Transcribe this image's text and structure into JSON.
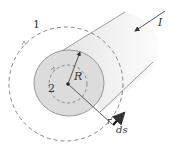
{
  "diagram": {
    "labels": {
      "loop_outer": "1",
      "loop_inner": "2",
      "radius_conductor": "R",
      "radius_loop": "r",
      "line_element": "ds",
      "current": "I"
    },
    "colors": {
      "conductor_face": "#dcdcdc",
      "conductor_body": "#ececec",
      "dashed_loop": "#888888",
      "arrow": "#333333"
    }
  }
}
